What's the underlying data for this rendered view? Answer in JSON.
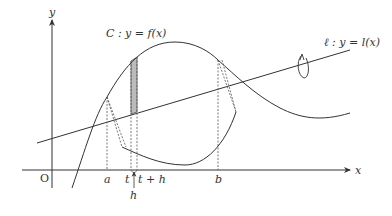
{
  "diagram": {
    "type": "rotation-volume-figure",
    "axes": {
      "x_label": "x",
      "y_label": "y",
      "origin_label": "O"
    },
    "curve_label": "C : y = f(x)",
    "line_label": "ℓ : y = l(x)",
    "tick_labels": {
      "a": "a",
      "t": "t",
      "t_plus_h": "t + h",
      "b": "b",
      "h": "h"
    },
    "colors": {
      "stroke": "#333333",
      "dotted": "#555555",
      "shade": "#bbbbbb",
      "background": "#ffffff"
    }
  }
}
